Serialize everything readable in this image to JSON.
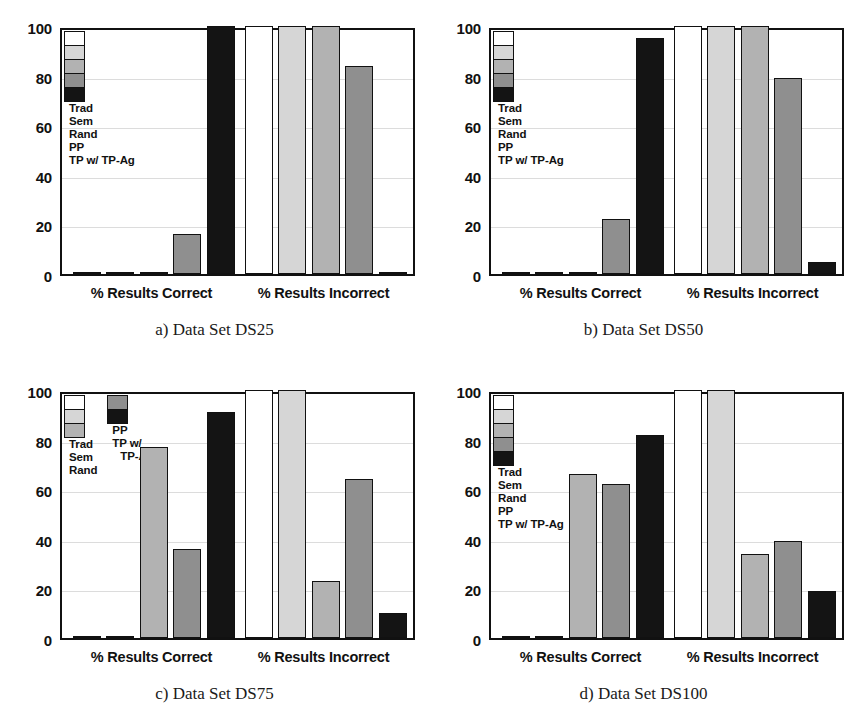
{
  "figure": {
    "panels": [
      {
        "id": "a",
        "caption": "a) Data Set DS25",
        "legend_layout": "single-column",
        "legend": [
          {
            "label": "Trad",
            "color": "#ffffff"
          },
          {
            "label": "Sem",
            "color": "#d6d6d6"
          },
          {
            "label": "Rand",
            "color": "#b2b2b2"
          },
          {
            "label": "PP",
            "color": "#8f8f8f"
          },
          {
            "label": "TP w/ TP-Ag",
            "color": "#141414"
          }
        ],
        "chart_data": {
          "type": "bar",
          "title": "a) Data Set DS25",
          "xlabel": "",
          "ylabel": "",
          "ylim": [
            0,
            100
          ],
          "yticks": [
            0,
            20,
            40,
            60,
            80,
            100
          ],
          "grid": true,
          "legend_position": "upper-left",
          "categories": [
            "% Results Correct",
            "% Results Incorrect"
          ],
          "series": [
            {
              "name": "Trad",
              "values": [
                0,
                100
              ]
            },
            {
              "name": "Sem",
              "values": [
                0,
                100
              ]
            },
            {
              "name": "Rand",
              "values": [
                0,
                100
              ]
            },
            {
              "name": "PP",
              "values": [
                16,
                84
              ]
            },
            {
              "name": "TP w/ TP-Ag",
              "values": [
                100,
                1
              ]
            }
          ]
        }
      },
      {
        "id": "b",
        "caption": "b) Data Set DS50",
        "legend_layout": "single-column",
        "legend": [
          {
            "label": "Trad",
            "color": "#ffffff"
          },
          {
            "label": "Sem",
            "color": "#d6d6d6"
          },
          {
            "label": "Rand",
            "color": "#b2b2b2"
          },
          {
            "label": "PP",
            "color": "#8f8f8f"
          },
          {
            "label": "TP w/ TP-Ag",
            "color": "#141414"
          }
        ],
        "chart_data": {
          "type": "bar",
          "title": "b) Data Set DS50",
          "xlabel": "",
          "ylabel": "",
          "ylim": [
            0,
            100
          ],
          "yticks": [
            0,
            20,
            40,
            60,
            80,
            100
          ],
          "grid": true,
          "legend_position": "upper-left",
          "categories": [
            "% Results Correct",
            "% Results Incorrect"
          ],
          "series": [
            {
              "name": "Trad",
              "values": [
                0,
                100
              ]
            },
            {
              "name": "Sem",
              "values": [
                0,
                100
              ]
            },
            {
              "name": "Rand",
              "values": [
                0,
                100
              ]
            },
            {
              "name": "PP",
              "values": [
                22,
                79
              ]
            },
            {
              "name": "TP w/ TP-Ag",
              "values": [
                95,
                5
              ]
            }
          ]
        }
      },
      {
        "id": "c",
        "caption": "c) Data Set DS75",
        "legend_layout": "two-column",
        "legend": [
          {
            "label": "Trad",
            "color": "#ffffff"
          },
          {
            "label": "Sem",
            "color": "#d6d6d6"
          },
          {
            "label": "Rand",
            "color": "#b2b2b2"
          },
          {
            "label": "PP",
            "color": "#8f8f8f"
          },
          {
            "label": "TP w/",
            "label2": "TP-Ag",
            "color": "#141414"
          }
        ],
        "chart_data": {
          "type": "bar",
          "title": "c) Data Set DS75",
          "xlabel": "",
          "ylabel": "",
          "ylim": [
            0,
            100
          ],
          "yticks": [
            0,
            20,
            40,
            60,
            80,
            100
          ],
          "grid": true,
          "legend_position": "upper-left",
          "categories": [
            "% Results Correct",
            "% Results Incorrect"
          ],
          "series": [
            {
              "name": "Trad",
              "values": [
                0,
                100
              ]
            },
            {
              "name": "Sem",
              "values": [
                0,
                100
              ]
            },
            {
              "name": "Rand",
              "values": [
                77,
                23
              ]
            },
            {
              "name": "PP",
              "values": [
                36,
                64
              ]
            },
            {
              "name": "TP w/ TP-Ag",
              "values": [
                91,
                10
              ]
            }
          ]
        }
      },
      {
        "id": "d",
        "caption": "d) Data Set DS100",
        "legend_layout": "single-column",
        "legend": [
          {
            "label": "Trad",
            "color": "#ffffff"
          },
          {
            "label": "Sem",
            "color": "#d6d6d6"
          },
          {
            "label": "Rand",
            "color": "#b2b2b2"
          },
          {
            "label": "PP",
            "color": "#8f8f8f"
          },
          {
            "label": "TP w/ TP-Ag",
            "color": "#141414"
          }
        ],
        "chart_data": {
          "type": "bar",
          "title": "d) Data Set DS100",
          "xlabel": "",
          "ylabel": "",
          "ylim": [
            0,
            100
          ],
          "yticks": [
            0,
            20,
            40,
            60,
            80,
            100
          ],
          "grid": true,
          "legend_position": "upper-left",
          "categories": [
            "% Results Correct",
            "% Results Incorrect"
          ],
          "series": [
            {
              "name": "Trad",
              "values": [
                0,
                100
              ]
            },
            {
              "name": "Sem",
              "values": [
                0,
                100
              ]
            },
            {
              "name": "Rand",
              "values": [
                66,
                34
              ]
            },
            {
              "name": "PP",
              "values": [
                62,
                39
              ]
            },
            {
              "name": "TP w/ TP-Ag",
              "values": [
                82,
                19
              ]
            }
          ]
        }
      }
    ]
  }
}
